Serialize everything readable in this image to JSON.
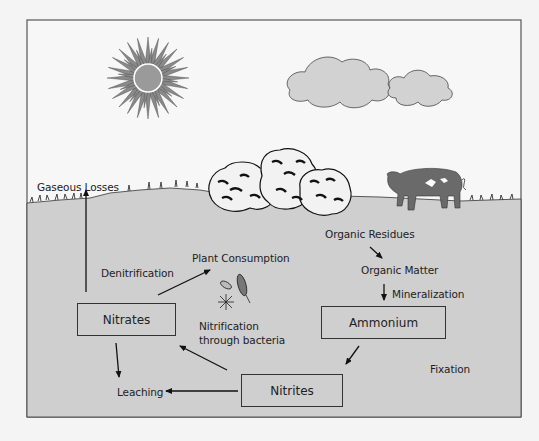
{
  "diagram": {
    "type": "nitrogen-cycle",
    "colors": {
      "sky": "#f7f7f7",
      "soil": "#cfcfcf",
      "frame": "#555555",
      "sun_core": "#9a9a9a",
      "sun_rays": "#8a8a8a",
      "cloud": "#d2d2d2",
      "pig": "#6a6a6a",
      "box_border": "#333333",
      "text": "#222222"
    },
    "labels": {
      "gaseous_losses": "Gaseous Losses",
      "denitrification": "Denitrification",
      "plant_consumption": "Plant Consumption",
      "nitrification_line1": "Nitrification",
      "nitrification_line2": "through bacteria",
      "leaching": "Leaching",
      "organic_residues": "Organic Residues",
      "organic_matter": "Organic Matter",
      "mineralization": "Mineralization",
      "fixation": "Fixation"
    },
    "boxes": {
      "nitrates": "Nitrates",
      "ammonium": "Ammonium",
      "nitrites": "Nitrites"
    },
    "icons": [
      "sun-icon",
      "cloud-icon",
      "bush-icon",
      "pig-icon",
      "bacteria-icon",
      "grass-icon"
    ]
  }
}
